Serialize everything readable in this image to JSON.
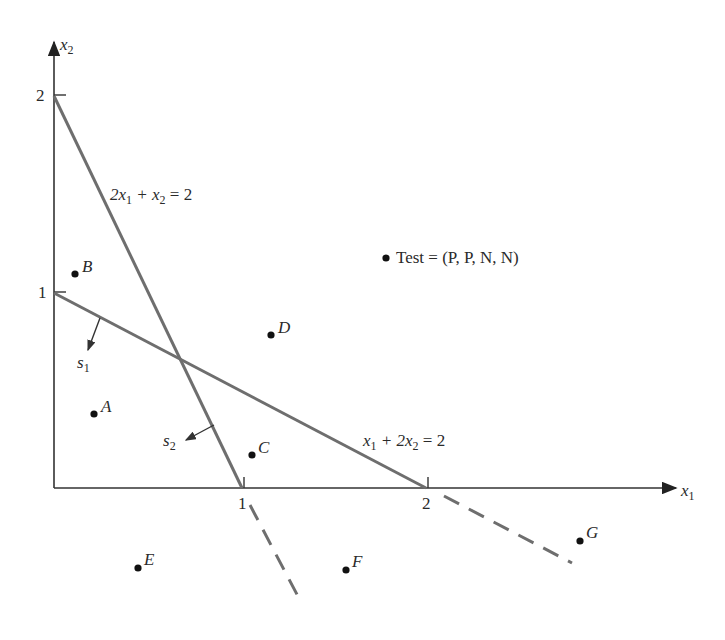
{
  "axes": {
    "x_label": "x",
    "x_sub": "1",
    "y_label": "x",
    "y_sub": "2",
    "x_ticks": [
      "1",
      "2"
    ],
    "y_ticks": [
      "1",
      "2"
    ]
  },
  "lines": {
    "line1": {
      "pre": "2x",
      "sub1": "1",
      "mid": " + x",
      "sub2": "2",
      "post": " = 2"
    },
    "line2": {
      "pre": "x",
      "sub1": "1",
      "mid": " + 2x",
      "sub2": "2",
      "post": " = 2"
    }
  },
  "normals": {
    "s1": {
      "label": "s",
      "sub": "1"
    },
    "s2": {
      "label": "s",
      "sub": "2"
    }
  },
  "points": {
    "A": "A",
    "B": "B",
    "C": "C",
    "D": "D",
    "E": "E",
    "F": "F",
    "G": "G"
  },
  "test": {
    "label": "Test = (P, P, N, N)"
  },
  "colors": {
    "line": "#6e6e6e",
    "axis": "#333333",
    "point": "#111111"
  }
}
